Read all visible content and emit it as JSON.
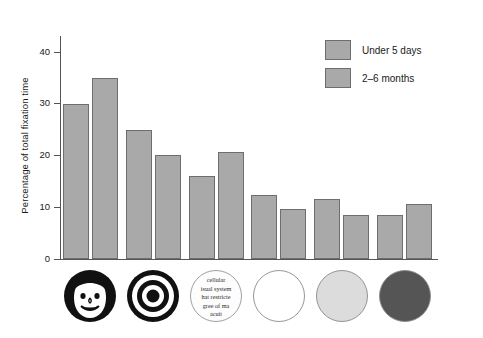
{
  "chart_data": {
    "type": "bar",
    "title": "",
    "xlabel": "",
    "ylabel": "Percentage of total fixation time",
    "ylim": [
      0,
      43
    ],
    "yticks": [
      0,
      10,
      20,
      30,
      40
    ],
    "ytick_labels": [
      "0",
      "10",
      "20",
      "30",
      "40"
    ],
    "grid": false,
    "legend_position": "top-right",
    "categories": [
      "face",
      "bullseye",
      "newsprint",
      "white",
      "yellow",
      "red"
    ],
    "category_labels": [
      "Face",
      "Bullseye",
      "Newsprint",
      "White circle",
      "Yellow circle",
      "Red circle"
    ],
    "series": [
      {
        "name": "Under 5 days",
        "color": "#a9a9a9",
        "values": [
          29.8,
          24.9,
          16.1,
          12.3,
          11.5,
          8.4
        ]
      },
      {
        "name": "2–6 months",
        "color": "#a9a9a9",
        "values": [
          35.0,
          20.1,
          20.6,
          9.6,
          8.5,
          10.6
        ]
      }
    ]
  },
  "legend": {
    "items": [
      {
        "label": "Under 5 days",
        "color": "#a9a9a9"
      },
      {
        "label": "2–6 months",
        "color": "#a9a9a9"
      }
    ]
  },
  "axis": {
    "y_title": "Percentage of total fixation time",
    "y_ticks": [
      "40",
      "30",
      "20",
      "10",
      "0"
    ]
  },
  "stimuli": [
    {
      "id": "face",
      "name": "face-stimulus",
      "label": "Face"
    },
    {
      "id": "bullseye",
      "name": "bullseye-stimulus",
      "label": "Bullseye"
    },
    {
      "id": "newsprint",
      "name": "newsprint-stimulus",
      "label": "Newsprint",
      "lines": [
        "cellular",
        "isual system",
        "hat restricte",
        "gree of ma",
        "acuit"
      ]
    },
    {
      "id": "white",
      "name": "white-circle-stimulus",
      "label": "White circle",
      "fill": "#ffffff"
    },
    {
      "id": "yellow",
      "name": "yellow-circle-stimulus",
      "label": "Yellow circle",
      "fill": "#dcdcdc"
    },
    {
      "id": "red",
      "name": "red-circle-stimulus",
      "label": "Red circle",
      "fill": "#555555"
    }
  ]
}
